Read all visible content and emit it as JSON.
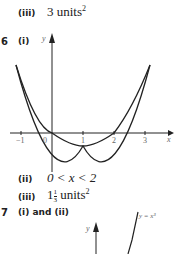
{
  "items": [
    {
      "label": "(iii)",
      "answer_prefix": "3 units",
      "sup": "2"
    },
    {
      "number": "6",
      "part": "(i)"
    },
    {
      "label": "(ii)",
      "answer": "0 < x < 2"
    },
    {
      "label": "(iii)",
      "whole": "1",
      "num": "1",
      "den": "3",
      "unit": "units",
      "sup": "2"
    },
    {
      "number": "7",
      "part": "(i) and (ii)"
    }
  ],
  "graph1": {
    "x_axis_label": "x",
    "y_axis_label": "y",
    "ticks": [
      "−1",
      "0",
      "1",
      "2",
      "3"
    ]
  },
  "graph2": {
    "y_axis_label": "y",
    "curve_label": "y = x³"
  }
}
